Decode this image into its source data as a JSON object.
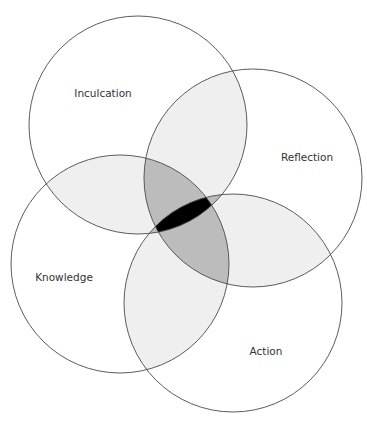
{
  "diagram": {
    "type": "venn",
    "circles": [
      {
        "id": "inculcation",
        "label": "Inculcation",
        "cx": 138,
        "cy": 125,
        "r": 109,
        "label_x": 103,
        "label_y": 93
      },
      {
        "id": "reflection",
        "label": "Reflection",
        "cx": 253,
        "cy": 178,
        "r": 109,
        "label_x": 307,
        "label_y": 157
      },
      {
        "id": "knowledge",
        "label": "Knowledge",
        "cx": 120,
        "cy": 264,
        "r": 109,
        "label_x": 64,
        "label_y": 277
      },
      {
        "id": "action",
        "label": "Action",
        "cx": 233,
        "cy": 303,
        "r": 109,
        "label_x": 266,
        "label_y": 351
      }
    ],
    "colors": {
      "background": "#ffffff",
      "stroke": "#4a4a4a",
      "pair_overlap": "#efefef",
      "triple_overlap": "#bcbcbc",
      "all_overlap": "#000000"
    }
  }
}
